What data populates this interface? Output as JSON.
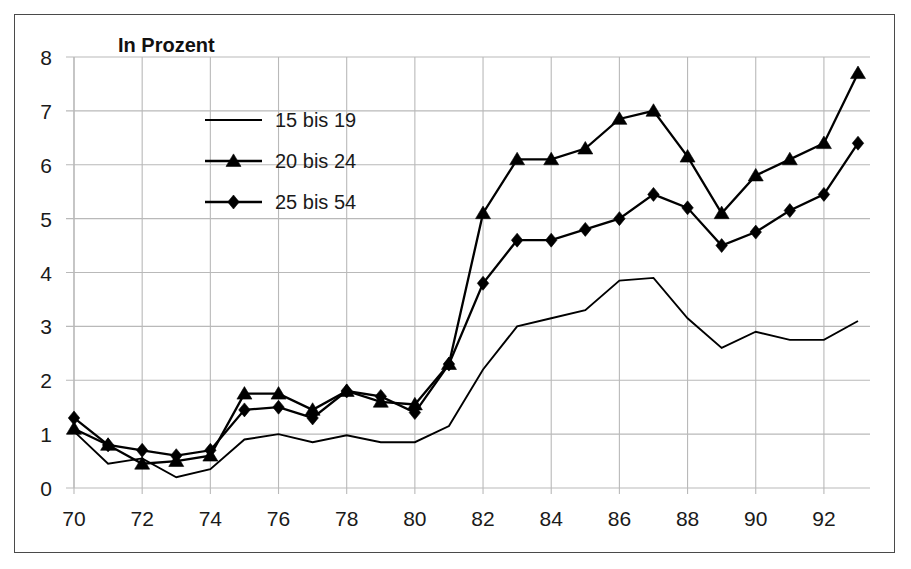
{
  "chart_data": {
    "type": "line",
    "title": "In Prozent",
    "xlabel": "",
    "ylabel": "",
    "xlim": [
      70,
      93
    ],
    "ylim": [
      0,
      8
    ],
    "yticks": [
      0,
      1,
      2,
      3,
      4,
      5,
      6,
      7,
      8
    ],
    "xticks": [
      70,
      72,
      74,
      76,
      78,
      80,
      82,
      84,
      86,
      88,
      90,
      92
    ],
    "x": [
      70,
      71,
      72,
      73,
      74,
      75,
      76,
      77,
      78,
      79,
      80,
      81,
      82,
      83,
      84,
      85,
      86,
      87,
      88,
      89,
      90,
      91,
      92,
      93
    ],
    "grid": true,
    "legend_position": "upper-left-inside",
    "series": [
      {
        "name": "15 bis 19",
        "marker": "none",
        "values": [
          1.05,
          0.45,
          0.55,
          0.2,
          0.35,
          0.9,
          1.0,
          0.85,
          0.98,
          0.85,
          0.85,
          1.15,
          2.2,
          3.0,
          3.15,
          3.3,
          3.85,
          3.9,
          3.15,
          2.6,
          2.9,
          2.75,
          2.75,
          3.1
        ]
      },
      {
        "name": "20 bis 24",
        "marker": "triangle",
        "values": [
          1.1,
          0.8,
          0.45,
          0.5,
          0.6,
          1.75,
          1.75,
          1.45,
          1.8,
          1.6,
          1.55,
          2.3,
          5.1,
          6.1,
          6.1,
          6.3,
          6.85,
          7.0,
          6.15,
          5.1,
          5.8,
          6.1,
          6.4,
          7.7
        ]
      },
      {
        "name": "25 bis 54",
        "marker": "diamond",
        "values": [
          1.3,
          0.8,
          0.7,
          0.6,
          0.7,
          1.45,
          1.5,
          1.3,
          1.8,
          1.7,
          1.4,
          2.3,
          3.8,
          4.6,
          4.6,
          4.8,
          5.0,
          5.45,
          5.2,
          4.5,
          4.75,
          5.15,
          5.45,
          6.4
        ]
      }
    ]
  },
  "figure": {
    "title": "In Prozent",
    "legend": [
      {
        "label": "15 bis 19",
        "marker": "none"
      },
      {
        "label": "20 bis 24",
        "marker": "triangle"
      },
      {
        "label": "25 bis 54",
        "marker": "diamond"
      }
    ],
    "y_tick_labels": [
      "8",
      "7",
      "6",
      "5",
      "4",
      "3",
      "2",
      "1",
      "0"
    ],
    "x_tick_labels": [
      "70",
      "72",
      "74",
      "76",
      "78",
      "80",
      "82",
      "84",
      "86",
      "88",
      "90",
      "92"
    ],
    "colors": {
      "line": "#000000",
      "grid": "#b9b9b9",
      "frame": "#4a4a4a",
      "background": "#ffffff",
      "text": "#1a1a1a"
    }
  }
}
